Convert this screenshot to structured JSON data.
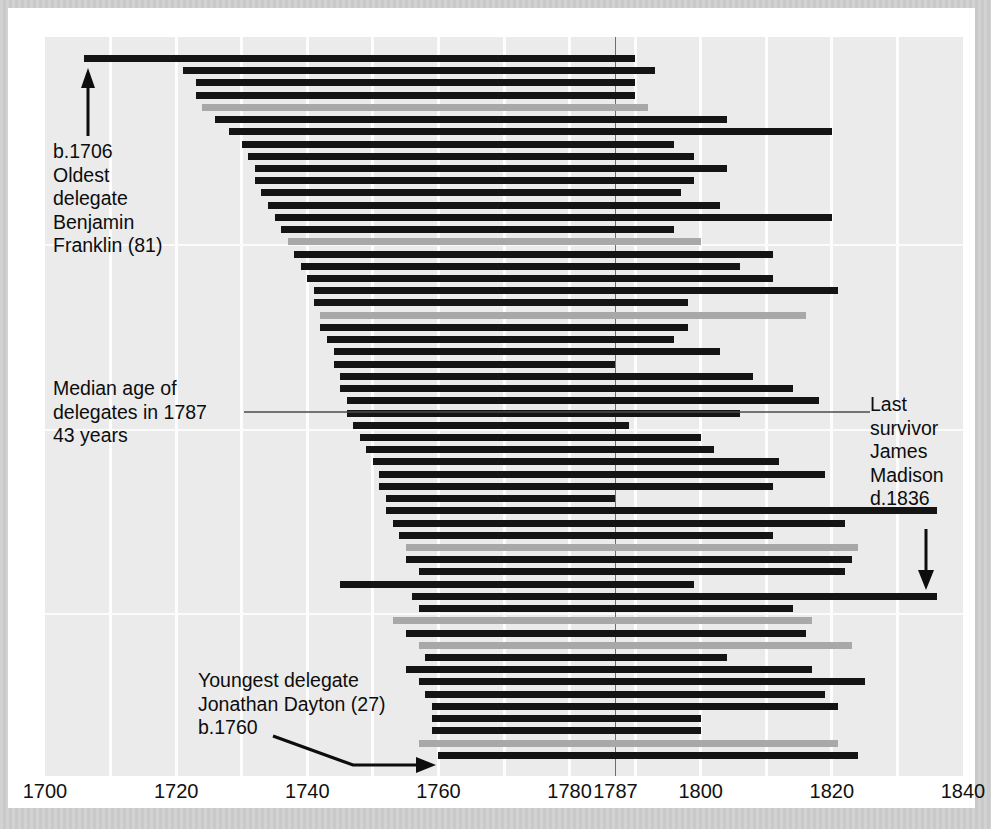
{
  "chart_data": {
    "type": "bar",
    "orientation": "horizontal-range",
    "title": "",
    "subtitle": "",
    "xlabel": "",
    "ylabel": "",
    "xlim": [
      1700,
      1840
    ],
    "xticks": [
      1700,
      1720,
      1740,
      1760,
      1780,
      1787,
      1800,
      1820,
      1840
    ],
    "xtick_labels": [
      "1700",
      "1720",
      "1740",
      "1760",
      "1780",
      "1787",
      "1800",
      "1820",
      "1840"
    ],
    "grid": "vertical-light",
    "legend": "none",
    "reference_line": {
      "x": 1787,
      "label": "1787",
      "color": "#6e6e6e"
    },
    "series": [
      {
        "name": "lifespan-dark",
        "color": "#141414"
      },
      {
        "name": "lifespan-gray",
        "color": "#a8a8a8"
      }
    ],
    "bars": [
      {
        "start": 1706,
        "end": 1790,
        "color": "dark"
      },
      {
        "start": 1721,
        "end": 1793,
        "color": "dark"
      },
      {
        "start": 1723,
        "end": 1790,
        "color": "dark"
      },
      {
        "start": 1723,
        "end": 1790,
        "color": "dark"
      },
      {
        "start": 1724,
        "end": 1792,
        "color": "gray"
      },
      {
        "start": 1726,
        "end": 1804,
        "color": "dark"
      },
      {
        "start": 1728,
        "end": 1820,
        "color": "dark"
      },
      {
        "start": 1730,
        "end": 1796,
        "color": "dark"
      },
      {
        "start": 1731,
        "end": 1799,
        "color": "dark"
      },
      {
        "start": 1732,
        "end": 1804,
        "color": "dark"
      },
      {
        "start": 1732,
        "end": 1799,
        "color": "dark"
      },
      {
        "start": 1733,
        "end": 1797,
        "color": "dark"
      },
      {
        "start": 1734,
        "end": 1803,
        "color": "dark"
      },
      {
        "start": 1735,
        "end": 1820,
        "color": "dark"
      },
      {
        "start": 1736,
        "end": 1796,
        "color": "dark"
      },
      {
        "start": 1737,
        "end": 1800,
        "color": "gray"
      },
      {
        "start": 1738,
        "end": 1811,
        "color": "dark"
      },
      {
        "start": 1739,
        "end": 1806,
        "color": "dark"
      },
      {
        "start": 1740,
        "end": 1811,
        "color": "dark"
      },
      {
        "start": 1741,
        "end": 1821,
        "color": "dark"
      },
      {
        "start": 1741,
        "end": 1798,
        "color": "dark"
      },
      {
        "start": 1742,
        "end": 1816,
        "color": "gray"
      },
      {
        "start": 1742,
        "end": 1798,
        "color": "dark"
      },
      {
        "start": 1743,
        "end": 1796,
        "color": "dark"
      },
      {
        "start": 1744,
        "end": 1803,
        "color": "dark"
      },
      {
        "start": 1744,
        "end": 1787,
        "color": "dark"
      },
      {
        "start": 1745,
        "end": 1808,
        "color": "dark"
      },
      {
        "start": 1745,
        "end": 1814,
        "color": "dark"
      },
      {
        "start": 1746,
        "end": 1818,
        "color": "dark"
      },
      {
        "start": 1746,
        "end": 1806,
        "color": "dark"
      },
      {
        "start": 1747,
        "end": 1789,
        "color": "dark"
      },
      {
        "start": 1748,
        "end": 1800,
        "color": "dark"
      },
      {
        "start": 1749,
        "end": 1802,
        "color": "dark"
      },
      {
        "start": 1750,
        "end": 1812,
        "color": "dark"
      },
      {
        "start": 1751,
        "end": 1819,
        "color": "dark"
      },
      {
        "start": 1751,
        "end": 1811,
        "color": "dark"
      },
      {
        "start": 1752,
        "end": 1787,
        "color": "dark"
      },
      {
        "start": 1752,
        "end": 1836,
        "color": "dark"
      },
      {
        "start": 1753,
        "end": 1822,
        "color": "dark"
      },
      {
        "start": 1754,
        "end": 1811,
        "color": "dark"
      },
      {
        "start": 1755,
        "end": 1824,
        "color": "gray"
      },
      {
        "start": 1755,
        "end": 1823,
        "color": "dark"
      },
      {
        "start": 1757,
        "end": 1822,
        "color": "dark"
      },
      {
        "start": 1745,
        "end": 1799,
        "color": "dark"
      },
      {
        "start": 1756,
        "end": 1836,
        "color": "dark"
      },
      {
        "start": 1757,
        "end": 1814,
        "color": "dark"
      },
      {
        "start": 1753,
        "end": 1817,
        "color": "gray"
      },
      {
        "start": 1755,
        "end": 1816,
        "color": "dark"
      },
      {
        "start": 1757,
        "end": 1823,
        "color": "gray"
      },
      {
        "start": 1758,
        "end": 1804,
        "color": "dark"
      },
      {
        "start": 1755,
        "end": 1817,
        "color": "dark"
      },
      {
        "start": 1757,
        "end": 1825,
        "color": "dark"
      },
      {
        "start": 1758,
        "end": 1819,
        "color": "dark"
      },
      {
        "start": 1759,
        "end": 1821,
        "color": "dark"
      },
      {
        "start": 1759,
        "end": 1800,
        "color": "dark"
      },
      {
        "start": 1759,
        "end": 1800,
        "color": "dark"
      },
      {
        "start": 1757,
        "end": 1821,
        "color": "gray"
      },
      {
        "start": 1760,
        "end": 1824,
        "color": "dark"
      }
    ]
  },
  "annotations": {
    "franklin": {
      "lines": [
        "b.1706",
        "Oldest",
        "delegate",
        "Benjamin",
        "Franklin (81)"
      ],
      "arrow": "up-arrow"
    },
    "median": {
      "lines": [
        "Median age of",
        "delegates in 1787",
        "43 years"
      ],
      "leader": "horizontal-leader-line"
    },
    "madison": {
      "lines": [
        "Last",
        "survivor",
        "James",
        "Madison",
        "d.1836"
      ],
      "arrow": "down-arrow"
    },
    "dayton": {
      "lines": [
        "Youngest delegate",
        "Jonathan Dayton (27)",
        "b.1760"
      ],
      "arrow": "diagonal-right-arrow"
    }
  },
  "colors": {
    "bar_dark": "#141414",
    "bar_gray": "#a8a8a8",
    "panel_background": "#ebebeb",
    "sheet_background": "#ffffff",
    "frame_background": "#cccccc",
    "reference_line": "#6e6e6e",
    "grid_line": "#fdfdfd",
    "text": "#0d0d0d"
  }
}
